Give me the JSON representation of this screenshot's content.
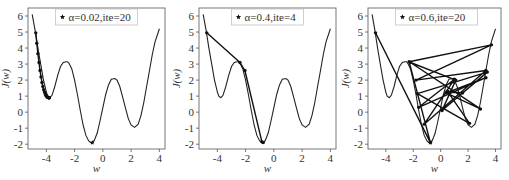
{
  "chart_data": [
    {
      "type": "line",
      "title": "",
      "legend": "★ α=0.02,ite=20",
      "legend_marker": "star",
      "alpha": 0.02,
      "iterations": 20,
      "xlabel": "w",
      "ylabel": "J(w)",
      "xlim": [
        -5.3,
        4.4
      ],
      "ylim": [
        -2.3,
        6.5
      ],
      "xticks": [
        -4,
        -2,
        0,
        2,
        4
      ],
      "yticks": [
        -2,
        -1,
        0,
        1,
        2,
        3,
        4,
        5,
        6
      ],
      "grid": false,
      "iterates_w": [
        -4.75,
        -4.68,
        -4.6,
        -4.52,
        -4.45,
        -4.38,
        -4.31,
        -4.25,
        -4.19,
        -4.13,
        -4.08,
        -4.03,
        -3.99,
        -3.95,
        -3.92,
        -3.89,
        -3.86,
        -3.84,
        -3.82,
        -3.8,
        -3.79
      ],
      "iterates_J": [
        4.95,
        4.3,
        3.65,
        3.1,
        2.6,
        2.2,
        1.85,
        1.6,
        1.4,
        1.25,
        1.13,
        1.05,
        1.0,
        0.96,
        0.93,
        0.92,
        0.91,
        0.9,
        0.9,
        0.9,
        0.9
      ],
      "final_marker": {
        "w": -0.75,
        "J": -1.9
      }
    },
    {
      "type": "line",
      "title": "",
      "legend": "★ α=0.4,ite=4",
      "legend_marker": "star",
      "alpha": 0.4,
      "iterations": 4,
      "xlabel": "w",
      "ylabel": "J(w)",
      "xlim": [
        -5.3,
        4.4
      ],
      "ylim": [
        -2.3,
        6.5
      ],
      "xticks": [
        -4,
        -2,
        0,
        2,
        4
      ],
      "yticks": [
        -2,
        -1,
        0,
        1,
        2,
        3,
        4,
        5,
        6
      ],
      "grid": false,
      "iterates_w": [
        -4.75,
        -2.4,
        -2.05,
        -0.85,
        -0.75
      ],
      "iterates_J": [
        4.95,
        3.1,
        2.6,
        -1.85,
        -1.9
      ]
    },
    {
      "type": "line",
      "title": "",
      "legend": "★ α=0.6,ite=20",
      "legend_marker": "star",
      "alpha": 0.6,
      "iterations": 20,
      "xlabel": "w",
      "ylabel": "J(w)",
      "xlim": [
        -5.3,
        4.4
      ],
      "ylim": [
        -2.3,
        6.5
      ],
      "xticks": [
        -4,
        -2,
        0,
        2,
        4
      ],
      "yticks": [
        -2,
        -1,
        0,
        1,
        2,
        3,
        4,
        5,
        6
      ],
      "grid": false,
      "iterates_w": [
        -4.75,
        -0.75,
        -2.3,
        3.7,
        -1.8,
        3.3,
        -1.2,
        1.0,
        -1.6,
        3.3,
        0.4,
        2.9,
        -2.2,
        1.1,
        0.1,
        3.4,
        -1.7,
        2.1,
        0.5,
        1.6,
        0.4
      ],
      "iterates_J": [
        4.95,
        -1.9,
        3.15,
        4.2,
        2.0,
        2.6,
        -0.75,
        2.05,
        0.3,
        2.15,
        1.2,
        0.2,
        3.1,
        2.0,
        0.1,
        2.5,
        1.15,
        -0.7,
        1.3,
        1.2,
        1.25
      ],
      "final_marker": {
        "w": -0.75,
        "J": -1.9
      }
    }
  ],
  "curve": {
    "description": "objective J(w) with two local minima and one global minimum",
    "w": [
      -5.0,
      -4.8,
      -4.6,
      -4.4,
      -4.2,
      -4.0,
      -3.9,
      -3.75,
      -3.6,
      -3.4,
      -3.2,
      -3.0,
      -2.8,
      -2.6,
      -2.5,
      -2.4,
      -2.2,
      -2.0,
      -1.8,
      -1.6,
      -1.4,
      -1.2,
      -1.0,
      -0.85,
      -0.75,
      -0.6,
      -0.4,
      -0.2,
      0.0,
      0.2,
      0.4,
      0.6,
      0.85,
      1.0,
      1.2,
      1.4,
      1.6,
      1.8,
      2.0,
      2.25,
      2.5,
      2.7,
      2.9,
      3.1,
      3.3,
      3.5,
      3.7,
      4.0
    ],
    "J": [
      6.1,
      5.1,
      4.0,
      3.0,
      2.0,
      1.25,
      1.0,
      0.9,
      1.05,
      1.6,
      2.3,
      2.85,
      3.1,
      3.15,
      3.15,
      3.05,
      2.7,
      2.0,
      1.1,
      0.1,
      -0.8,
      -1.45,
      -1.8,
      -1.9,
      -1.9,
      -1.75,
      -1.3,
      -0.55,
      0.3,
      1.1,
      1.7,
      2.05,
      2.1,
      2.0,
      1.6,
      0.95,
      0.25,
      -0.4,
      -0.8,
      -0.95,
      -0.75,
      -0.2,
      0.6,
      1.6,
      2.6,
      3.6,
      4.4,
      5.2
    ]
  },
  "panels": [
    {
      "legend_text": "α=0.02,ite=20"
    },
    {
      "legend_text": "α=0.4,ite=4"
    },
    {
      "legend_text": "α=0.6,ite=20"
    }
  ],
  "axis": {
    "xlabel": "w",
    "ylabel": "J(w)",
    "xtick_labels": [
      "-4",
      "-2",
      "0",
      "2",
      "4"
    ],
    "ytick_labels": [
      "-2",
      "-1",
      "0",
      "1",
      "2",
      "3",
      "4",
      "5",
      "6"
    ]
  },
  "legend_star": "★"
}
